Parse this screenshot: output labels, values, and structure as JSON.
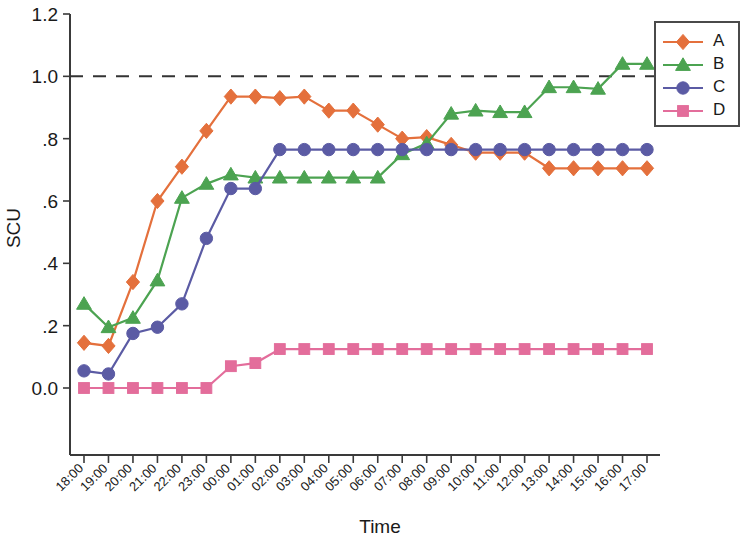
{
  "chart_data": {
    "type": "line",
    "title": "",
    "xlabel": "Time",
    "ylabel": "SCU",
    "ylim": [
      -0.08,
      1.26
    ],
    "yticks": [
      0.0,
      0.2,
      0.4,
      0.6,
      0.8,
      1.0,
      1.2
    ],
    "ytick_labels": [
      "0.0",
      ".2",
      ".4",
      ".6",
      ".8",
      "1.0",
      "1.2"
    ],
    "grid": false,
    "legend_position": "upper right",
    "reference_line": {
      "y": 1.0,
      "style": "dashed",
      "color": "#333333"
    },
    "categories": [
      "18:00",
      "19:00",
      "20:00",
      "21:00",
      "22:00",
      "23:00",
      "00:00",
      "01:00",
      "02:00",
      "03:00",
      "04:00",
      "05:00",
      "06:00",
      "07:00",
      "08:00",
      "09:00",
      "10:00",
      "11:00",
      "12:00",
      "13:00",
      "14:00",
      "15:00",
      "16:00",
      "17:00"
    ],
    "series": [
      {
        "name": "A",
        "color": "#E4703C",
        "marker": "diamond",
        "values": [
          0.145,
          0.135,
          0.34,
          0.6,
          0.71,
          0.825,
          0.935,
          0.935,
          0.93,
          0.935,
          0.89,
          0.89,
          0.845,
          0.8,
          0.805,
          0.78,
          0.755,
          0.755,
          0.755,
          0.705,
          0.705,
          0.705,
          0.705,
          0.705
        ]
      },
      {
        "name": "B",
        "color": "#4CA351",
        "marker": "triangle",
        "values": [
          0.27,
          0.195,
          0.225,
          0.345,
          0.61,
          0.655,
          0.685,
          0.675,
          0.675,
          0.675,
          0.675,
          0.675,
          0.675,
          0.75,
          0.785,
          0.88,
          0.89,
          0.885,
          0.885,
          0.965,
          0.965,
          0.96,
          1.04,
          1.04
        ]
      },
      {
        "name": "C",
        "color": "#5B5BA4",
        "marker": "circle",
        "values": [
          0.055,
          0.045,
          0.175,
          0.195,
          0.27,
          0.48,
          0.64,
          0.64,
          0.765,
          0.765,
          0.765,
          0.765,
          0.765,
          0.765,
          0.765,
          0.765,
          0.765,
          0.765,
          0.765,
          0.765,
          0.765,
          0.765,
          0.765,
          0.765
        ]
      },
      {
        "name": "D",
        "color": "#E36D9B",
        "marker": "square",
        "values": [
          0.0,
          0.0,
          0.0,
          0.0,
          0.0,
          0.0,
          0.07,
          0.08,
          0.125,
          0.125,
          0.125,
          0.125,
          0.125,
          0.125,
          0.125,
          0.125,
          0.125,
          0.125,
          0.125,
          0.125,
          0.125,
          0.125,
          0.125,
          0.125
        ]
      }
    ]
  },
  "legend": {
    "entries": [
      {
        "label": "A"
      },
      {
        "label": "B"
      },
      {
        "label": "C"
      },
      {
        "label": "D"
      }
    ]
  },
  "axes": {
    "x_title": "Time",
    "y_title": "SCU"
  }
}
